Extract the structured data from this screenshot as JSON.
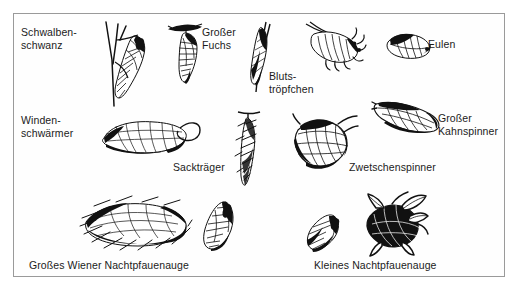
{
  "plate": {
    "title": "Puppen von Schmetterlingen",
    "frame_color": "#9a9a9a",
    "background_color": "#fefefe",
    "ink_color": "#1b1b1b",
    "caption_font_size_px": 10.5
  },
  "labels": [
    {
      "id": "schwalbenschwanz",
      "text": "Schwalben-\nschwanz",
      "x": 7,
      "y": 12,
      "align": "left"
    },
    {
      "id": "grosser-fuchs",
      "text": "Großer\nFuchs",
      "x": 188,
      "y": 12,
      "align": "left"
    },
    {
      "id": "blutstroepfchen",
      "text": "Bluts-\ntröpfchen",
      "x": 255,
      "y": 56,
      "align": "left"
    },
    {
      "id": "eulen",
      "text": "Eulen",
      "x": 414,
      "y": 24,
      "align": "left"
    },
    {
      "id": "windenschwaermer",
      "text": "Winden-\nschwärmer",
      "x": 7,
      "y": 100,
      "align": "left"
    },
    {
      "id": "grosser-kahnspinner",
      "text": "Großer\nKahnspinner",
      "x": 424,
      "y": 98,
      "align": "left"
    },
    {
      "id": "secktraeger",
      "text": "Sackträger",
      "x": 159,
      "y": 147,
      "align": "left"
    },
    {
      "id": "zwetschenspinner",
      "text": "Zwetschenspinner",
      "x": 335,
      "y": 147,
      "align": "left"
    },
    {
      "id": "grosses-wiener",
      "text": "Großes Wiener Nachtpfauenauge",
      "x": 15,
      "y": 245,
      "align": "left"
    },
    {
      "id": "kleines",
      "text": "Kleines Nachtpfauenauge",
      "x": 300,
      "y": 245,
      "align": "left"
    }
  ],
  "figures": [
    {
      "id": "schwalbenschwanz-puppe",
      "name": "swallowtail-chrysalis-on-twig",
      "x": 78,
      "y": 6,
      "w": 70,
      "h": 88
    },
    {
      "id": "grosser-fuchs-puppe",
      "name": "hanging-pupa",
      "x": 152,
      "y": 6,
      "w": 48,
      "h": 66
    },
    {
      "id": "blutstroepfchen-puppe",
      "name": "burnet-moth-cocoon-on-stem",
      "x": 232,
      "y": 8,
      "w": 30,
      "h": 72
    },
    {
      "id": "raupe-puppe",
      "name": "caterpillar-pupating",
      "x": 290,
      "y": 6,
      "w": 66,
      "h": 52
    },
    {
      "id": "eulen-puppe",
      "name": "noctuid-pupa",
      "x": 368,
      "y": 14,
      "w": 52,
      "h": 36
    },
    {
      "id": "windenschwaermer-puppe",
      "name": "hawkmoth-pupa-with-proboscis",
      "x": 82,
      "y": 96,
      "w": 110,
      "h": 52
    },
    {
      "id": "kahnspinner-kokon",
      "name": "boat-shaped-cocoon",
      "x": 358,
      "y": 82,
      "w": 72,
      "h": 42
    },
    {
      "id": "secktraeger-sack",
      "name": "bagworm-case",
      "x": 218,
      "y": 96,
      "w": 32,
      "h": 80
    },
    {
      "id": "zwetschenspinner-kokon",
      "name": "leaf-wrapped-cocoon",
      "x": 278,
      "y": 100,
      "w": 66,
      "h": 62
    },
    {
      "id": "grosses-wiener-kokon",
      "name": "large-silk-cocoon-nest",
      "x": 62,
      "y": 182,
      "w": 116,
      "h": 56
    },
    {
      "id": "grosses-wiener-puppe",
      "name": "large-emperor-pupa",
      "x": 186,
      "y": 184,
      "w": 40,
      "h": 56
    },
    {
      "id": "kleines-puppe",
      "name": "small-emperor-pupa",
      "x": 290,
      "y": 198,
      "w": 40,
      "h": 42
    },
    {
      "id": "kleines-kokon",
      "name": "small-emperor-cocoon",
      "x": 348,
      "y": 180,
      "w": 66,
      "h": 62
    }
  ]
}
